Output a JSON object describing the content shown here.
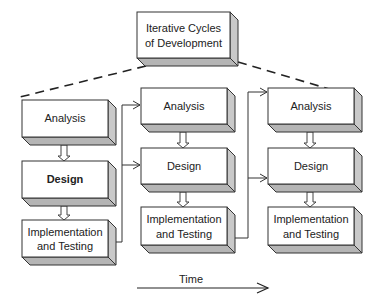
{
  "diagram": {
    "title_box": {
      "line1": "Iterative Cycles",
      "line2": "of Development"
    },
    "cycles": [
      {
        "analysis": "Analysis",
        "design": "Design",
        "implementation_line1": "Implementation",
        "implementation_line2": "and Testing"
      },
      {
        "analysis": "Analysis",
        "design": "Design",
        "implementation_line1": "Implementation",
        "implementation_line2": "and Testing"
      },
      {
        "analysis": "Analysis",
        "design": "Design",
        "implementation_line1": "Implementation",
        "implementation_line2": "and Testing"
      }
    ],
    "time_axis": {
      "label": "Time"
    },
    "colors": {
      "box_face": "#ffffff",
      "box_side": "#c9c9c9",
      "box_bottom": "#b5b5b5",
      "stroke": "#333333"
    }
  }
}
